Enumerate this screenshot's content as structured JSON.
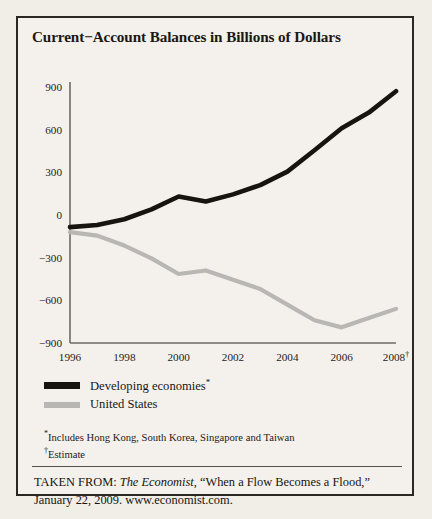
{
  "figure": {
    "title": "Current−Account Balances in Billions of Dollars",
    "legend": {
      "developing_label": "Developing economies",
      "developing_mark": "*",
      "us_label": "United States"
    },
    "footnotes": {
      "star_mark": "*",
      "star_text": "Includes Hong Kong, South Korea, Singapore and Taiwan",
      "dagger_mark": "†",
      "dagger_text": "Estimate"
    },
    "source": {
      "prefix": "TAKEN FROM: ",
      "publication": "The Economist",
      "article": ", “When a Flow Becomes a Flood,”",
      "second_line": "January 22, 2009. www.economist.com."
    },
    "colors": {
      "developing": "#17130f",
      "united_states": "#b9b7b3",
      "axis": "#6e6a66",
      "border": "#2b2722",
      "background": "#f4f1ec"
    }
  },
  "chart_data": {
    "type": "line",
    "title": "Current−Account Balances in Billions of Dollars",
    "xlabel": "",
    "ylabel": "",
    "x": [
      1996,
      1997,
      1998,
      1999,
      2000,
      2001,
      2002,
      2003,
      2004,
      2005,
      2006,
      2007,
      2008
    ],
    "tick_labels_x": [
      "1996",
      "1998",
      "2000",
      "2002",
      "2004",
      "2006",
      "2008†"
    ],
    "tick_values_x": [
      1996,
      1998,
      2000,
      2002,
      2004,
      2006,
      2008
    ],
    "tick_labels_y": [
      "900",
      "600",
      "300",
      "0",
      "−300",
      "−600",
      "−900"
    ],
    "tick_values_y": [
      900,
      600,
      300,
      0,
      -300,
      -600,
      -900
    ],
    "xlim": [
      1996,
      2008
    ],
    "ylim": [
      -900,
      900
    ],
    "grid": false,
    "legend_position": "below-axes",
    "units": "Billions of Dollars",
    "series": [
      {
        "name": "Developing economies*",
        "color": "#17130f",
        "values": [
          -85,
          -70,
          -30,
          40,
          130,
          95,
          145,
          210,
          305,
          455,
          610,
          720,
          870
        ]
      },
      {
        "name": "United States",
        "color": "#b9b7b3",
        "values": [
          -120,
          -145,
          -215,
          -305,
          -415,
          -390,
          -455,
          -520,
          -630,
          -740,
          -790,
          -725,
          -660
        ]
      }
    ],
    "annotations": [
      "2008 values are estimates (†)",
      "Developing economies includes Hong Kong, South Korea, Singapore and Taiwan (*)"
    ]
  }
}
